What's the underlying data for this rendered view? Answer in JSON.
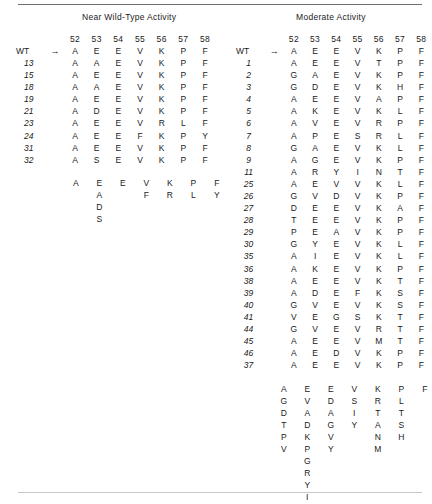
{
  "figure": {
    "positions": [
      "52",
      "53",
      "54",
      "55",
      "56",
      "57",
      "58"
    ],
    "wt_label": "WT",
    "arrow": "→",
    "wt_sequence": [
      "A",
      "E",
      "E",
      "V",
      "K",
      "P",
      "F"
    ]
  },
  "panels": [
    {
      "title": "Near Wild-Type Activity",
      "rows": [
        {
          "label": "13",
          "residues": [
            "A",
            "A",
            "E",
            "V",
            "K",
            "P",
            "F"
          ]
        },
        {
          "label": "15",
          "residues": [
            "A",
            "E",
            "E",
            "V",
            "K",
            "P",
            "F"
          ]
        },
        {
          "label": "18",
          "residues": [
            "A",
            "A",
            "E",
            "V",
            "K",
            "P",
            "F"
          ]
        },
        {
          "label": "19",
          "residues": [
            "A",
            "E",
            "E",
            "V",
            "K",
            "P",
            "F"
          ]
        },
        {
          "label": "21",
          "residues": [
            "A",
            "D",
            "E",
            "V",
            "K",
            "P",
            "F"
          ]
        },
        {
          "label": "23",
          "residues": [
            "A",
            "E",
            "E",
            "V",
            "R",
            "L",
            "F"
          ]
        },
        {
          "label": "24",
          "residues": [
            "A",
            "E",
            "E",
            "F",
            "K",
            "P",
            "Y"
          ]
        },
        {
          "label": "31",
          "residues": [
            "A",
            "E",
            "E",
            "V",
            "K",
            "P",
            "F"
          ]
        },
        {
          "label": "32",
          "residues": [
            "A",
            "S",
            "E",
            "V",
            "K",
            "P",
            "F"
          ]
        }
      ],
      "summary": [
        [
          "A"
        ],
        [
          "E",
          "A",
          "D",
          "S"
        ],
        [
          "E"
        ],
        [
          "V",
          "F"
        ],
        [
          "K",
          "R"
        ],
        [
          "P",
          "L"
        ],
        [
          "F",
          "Y"
        ]
      ]
    },
    {
      "title": "Moderate Activity",
      "rows": [
        {
          "label": "1",
          "residues": [
            "A",
            "E",
            "E",
            "V",
            "T",
            "P",
            "F"
          ]
        },
        {
          "label": "2",
          "residues": [
            "G",
            "A",
            "E",
            "V",
            "K",
            "P",
            "F"
          ]
        },
        {
          "label": "3",
          "residues": [
            "G",
            "D",
            "E",
            "V",
            "K",
            "H",
            "F"
          ]
        },
        {
          "label": "4",
          "residues": [
            "A",
            "E",
            "E",
            "V",
            "A",
            "P",
            "F"
          ]
        },
        {
          "label": "5",
          "residues": [
            "A",
            "K",
            "E",
            "V",
            "K",
            "L",
            "F"
          ]
        },
        {
          "label": "6",
          "residues": [
            "A",
            "V",
            "E",
            "V",
            "R",
            "P",
            "F"
          ]
        },
        {
          "label": "7",
          "residues": [
            "A",
            "P",
            "E",
            "S",
            "R",
            "L",
            "F"
          ]
        },
        {
          "label": "8",
          "residues": [
            "G",
            "A",
            "E",
            "V",
            "K",
            "L",
            "F"
          ]
        },
        {
          "label": "9",
          "residues": [
            "A",
            "G",
            "E",
            "V",
            "K",
            "P",
            "F"
          ]
        },
        {
          "label": "11",
          "residues": [
            "A",
            "R",
            "Y",
            "I",
            "N",
            "T",
            "F"
          ]
        },
        {
          "label": "25",
          "residues": [
            "A",
            "E",
            "V",
            "V",
            "K",
            "L",
            "F"
          ]
        },
        {
          "label": "26",
          "residues": [
            "G",
            "V",
            "D",
            "V",
            "K",
            "P",
            "F"
          ]
        },
        {
          "label": "27",
          "residues": [
            "D",
            "E",
            "E",
            "V",
            "K",
            "A",
            "F"
          ]
        },
        {
          "label": "28",
          "residues": [
            "T",
            "E",
            "E",
            "V",
            "K",
            "P",
            "F"
          ]
        },
        {
          "label": "29",
          "residues": [
            "P",
            "E",
            "A",
            "V",
            "K",
            "P",
            "F"
          ]
        },
        {
          "label": "30",
          "residues": [
            "G",
            "Y",
            "E",
            "V",
            "K",
            "L",
            "F"
          ]
        },
        {
          "label": "35",
          "residues": [
            "A",
            "I",
            "E",
            "V",
            "K",
            "L",
            "F"
          ]
        },
        {
          "label": "36",
          "residues": [
            "A",
            "K",
            "E",
            "V",
            "K",
            "P",
            "F"
          ]
        },
        {
          "label": "38",
          "residues": [
            "A",
            "E",
            "E",
            "V",
            "K",
            "T",
            "F"
          ]
        },
        {
          "label": "39",
          "residues": [
            "A",
            "D",
            "E",
            "F",
            "K",
            "S",
            "F"
          ]
        },
        {
          "label": "40",
          "residues": [
            "G",
            "V",
            "E",
            "V",
            "K",
            "S",
            "F"
          ]
        },
        {
          "label": "41",
          "residues": [
            "V",
            "E",
            "G",
            "S",
            "K",
            "T",
            "F"
          ]
        },
        {
          "label": "44",
          "residues": [
            "G",
            "V",
            "E",
            "V",
            "R",
            "T",
            "F"
          ]
        },
        {
          "label": "45",
          "residues": [
            "A",
            "E",
            "E",
            "V",
            "M",
            "T",
            "F"
          ]
        },
        {
          "label": "46",
          "residues": [
            "A",
            "E",
            "D",
            "V",
            "K",
            "P",
            "F"
          ]
        },
        {
          "label": "37",
          "residues": [
            "A",
            "E",
            "E",
            "V",
            "K",
            "P",
            "F"
          ]
        }
      ],
      "summary": [
        [
          "A",
          "G",
          "D",
          "T",
          "P",
          "V"
        ],
        [
          "E",
          "V",
          "A",
          "D",
          "K",
          "P",
          "G",
          "R",
          "Y",
          "I"
        ],
        [
          "E",
          "D",
          "A",
          "G",
          "V",
          "Y"
        ],
        [
          "V",
          "S",
          "I",
          "Y"
        ],
        [
          "K",
          "R",
          "T",
          "A",
          "N",
          "M"
        ],
        [
          "P",
          "L",
          "T",
          "S",
          "H"
        ],
        [
          "F"
        ]
      ]
    }
  ]
}
